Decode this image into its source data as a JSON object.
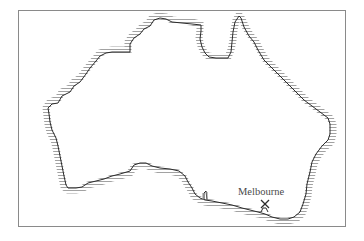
{
  "map": {
    "region": "Australia",
    "style": {
      "coast_color": "#2b2b2b",
      "hatch_color": "#7a7a7a",
      "frame_color": "#8a8a8a",
      "label_color": "#4a4a4a"
    },
    "markers": [
      {
        "label": "Melbourne",
        "symbol": "X",
        "x": 265,
        "y": 204
      }
    ]
  }
}
